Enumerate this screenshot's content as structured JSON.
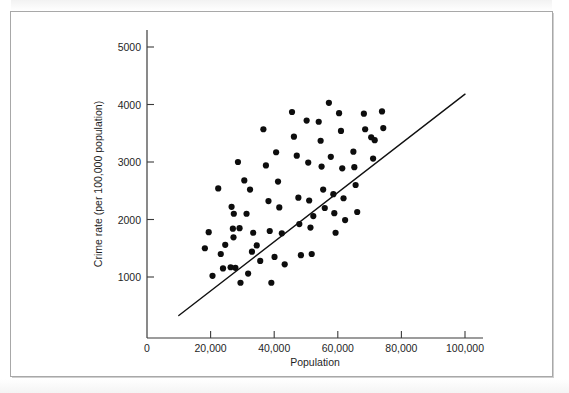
{
  "figure": {
    "background_color": "#ffffff",
    "frame_color": "#a8a8a8",
    "point_color": "#0d0d0d",
    "line_color": "#111111",
    "axis_color": "#3b3b3b"
  },
  "chart_data": {
    "type": "scatter",
    "title": "",
    "subtitle": "",
    "xlabel": "Population",
    "ylabel": "Crime rate (per 100,000 population)",
    "xlim": [
      0,
      105000
    ],
    "ylim": [
      0,
      5400
    ],
    "grid": false,
    "legend": null,
    "x_ticks": [
      0,
      20000,
      40000,
      60000,
      80000,
      100000
    ],
    "x_tick_labels": [
      "0",
      "20,000",
      "40,000",
      "60,000",
      "80,000",
      "100,000"
    ],
    "y_ticks": [
      1000,
      2000,
      3000,
      4000,
      5000
    ],
    "y_tick_labels": [
      "1000",
      "2000",
      "3000",
      "4000",
      "5000"
    ],
    "annotations": [],
    "series": [
      {
        "name": "cities",
        "marker": "filled-circle",
        "marker_size": 3.1,
        "color": "#0d0d0d",
        "points": [
          [
            18200,
            1500
          ],
          [
            19400,
            1780
          ],
          [
            20600,
            1020
          ],
          [
            22400,
            2540
          ],
          [
            23200,
            1400
          ],
          [
            23900,
            1150
          ],
          [
            24600,
            1560
          ],
          [
            26300,
            1170
          ],
          [
            26600,
            2220
          ],
          [
            27000,
            1840
          ],
          [
            27200,
            1690
          ],
          [
            27300,
            2100
          ],
          [
            27800,
            1160
          ],
          [
            28600,
            3000
          ],
          [
            29100,
            1850
          ],
          [
            29400,
            900
          ],
          [
            30600,
            2680
          ],
          [
            31300,
            2100
          ],
          [
            31800,
            1060
          ],
          [
            32400,
            2520
          ],
          [
            33000,
            1440
          ],
          [
            33400,
            1770
          ],
          [
            34500,
            1550
          ],
          [
            35600,
            1280
          ],
          [
            36600,
            3570
          ],
          [
            37400,
            2940
          ],
          [
            38200,
            2320
          ],
          [
            38600,
            1800
          ],
          [
            39100,
            900
          ],
          [
            40100,
            1350
          ],
          [
            40600,
            3170
          ],
          [
            41200,
            2660
          ],
          [
            41600,
            2210
          ],
          [
            42400,
            1760
          ],
          [
            43300,
            1220
          ],
          [
            45600,
            3870
          ],
          [
            46200,
            3440
          ],
          [
            47100,
            3110
          ],
          [
            47600,
            2380
          ],
          [
            47900,
            1920
          ],
          [
            48400,
            1380
          ],
          [
            50200,
            3720
          ],
          [
            50700,
            2990
          ],
          [
            51000,
            2330
          ],
          [
            51400,
            1860
          ],
          [
            51800,
            1400
          ],
          [
            52300,
            2060
          ],
          [
            54000,
            3700
          ],
          [
            54600,
            3370
          ],
          [
            54900,
            2920
          ],
          [
            55400,
            2520
          ],
          [
            55900,
            2200
          ],
          [
            57200,
            4030
          ],
          [
            57800,
            3090
          ],
          [
            58600,
            2440
          ],
          [
            58900,
            2110
          ],
          [
            59300,
            1770
          ],
          [
            60400,
            3850
          ],
          [
            61000,
            3540
          ],
          [
            61400,
            2890
          ],
          [
            61800,
            2370
          ],
          [
            62300,
            1990
          ],
          [
            64900,
            3180
          ],
          [
            65200,
            2910
          ],
          [
            65600,
            2600
          ],
          [
            66100,
            2130
          ],
          [
            68200,
            3840
          ],
          [
            68600,
            3570
          ],
          [
            70500,
            3430
          ],
          [
            71100,
            3060
          ],
          [
            71600,
            3380
          ],
          [
            73900,
            3880
          ],
          [
            74300,
            3590
          ]
        ]
      }
    ],
    "fit_line": {
      "name": "least-squares regression line",
      "x_start": 10000,
      "y_start": 330,
      "x_end": 100000,
      "y_end": 4180
    }
  }
}
